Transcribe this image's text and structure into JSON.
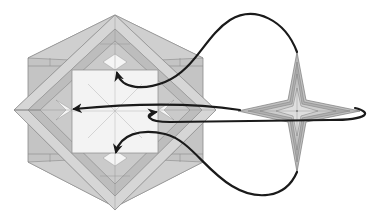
{
  "diagram": {
    "type": "origami-folding-step",
    "colors": {
      "background": "#ffffff",
      "paper_dark": "#b4b4b4",
      "paper_mid": "#c8c8c8",
      "paper_light": "#dcdcdc",
      "paper_white": "#f3f3f3",
      "crease": "#8a8a8a",
      "arrow": "#1a1a1a"
    },
    "base_model": {
      "shape": "hexagon-with-diamond-overlay",
      "center_square": {
        "x": 72,
        "y": 70,
        "width": 86,
        "height": 83
      }
    },
    "star_unit": {
      "shape": "four-pointed-star",
      "center": [
        297,
        111
      ],
      "arm_length": 60
    },
    "arrows": [
      {
        "name": "arrow-top",
        "from": "star-top-tip",
        "to": "square-top-center"
      },
      {
        "name": "arrow-left",
        "from": "star-left-tip",
        "to": "square-left-center"
      },
      {
        "name": "arrow-right-loop",
        "from": "star-right-tip",
        "to": "square-right-center"
      },
      {
        "name": "arrow-bottom",
        "from": "star-bottom-tip",
        "to": "square-bottom-center"
      }
    ]
  }
}
